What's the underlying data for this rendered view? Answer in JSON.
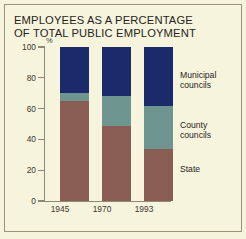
{
  "figure": {
    "title": "EMPLOYEES AS A PERCENTAGE\nOF TOTAL PUBLIC EMPLOYMENT",
    "y_unit": "%",
    "background_color": "#f7f4dd",
    "axis_color": "#8d8874",
    "text_color": "#25231c"
  },
  "legend": {
    "municipal": "Municipal\ncouncils",
    "county": "County\ncouncils",
    "state": "State"
  },
  "chart_data": {
    "type": "bar",
    "stacked": true,
    "title": "EMPLOYEES AS A PERCENTAGE OF TOTAL PUBLIC EMPLOYMENT",
    "xlabel": "",
    "ylabel": "%",
    "ylim": [
      0,
      100
    ],
    "yticks": [
      0,
      20,
      40,
      60,
      80,
      100
    ],
    "ytick_labels": [
      "0",
      "20",
      "40",
      "60",
      "80",
      "100"
    ],
    "grid": false,
    "legend_position": "right",
    "categories": [
      "1945",
      "1970",
      "1993"
    ],
    "series": [
      {
        "name": "State",
        "color": "#8a5d52",
        "values": [
          65,
          49,
          34
        ]
      },
      {
        "name": "County councils",
        "color": "#6e9590",
        "values": [
          5,
          19,
          28
        ]
      },
      {
        "name": "Municipal councils",
        "color": "#1b2a6b",
        "values": [
          30,
          32,
          38
        ]
      }
    ]
  }
}
